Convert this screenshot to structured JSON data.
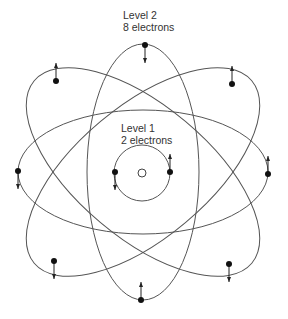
{
  "labels": {
    "level2_title": "Level 2",
    "level2_count": "8 electrons",
    "level1_title": "Level 1",
    "level1_count": "2 electrons"
  },
  "diagram": {
    "type": "atomic-shell-model",
    "nucleus": {
      "cx": 142,
      "cy": 173,
      "r": 4
    },
    "level1": {
      "orbit": {
        "cx": 142,
        "cy": 173,
        "r": 28
      },
      "electrons": [
        {
          "x": 115,
          "y": 172,
          "spin": "down"
        },
        {
          "x": 170,
          "y": 172,
          "spin": "up"
        }
      ]
    },
    "level2": {
      "orbits": [
        {
          "name": "horizontal",
          "cx": 143,
          "cy": 172,
          "rx": 125,
          "ry": 62,
          "rotate": 0
        },
        {
          "name": "vertical",
          "cx": 143,
          "cy": 172,
          "rx": 56,
          "ry": 128,
          "rotate": 0
        },
        {
          "name": "tilted-left",
          "cx": 143,
          "cy": 172,
          "rx": 142,
          "ry": 66,
          "rotate": 40
        },
        {
          "name": "tilted-right",
          "cx": 143,
          "cy": 172,
          "rx": 142,
          "ry": 66,
          "rotate": -40
        }
      ],
      "electrons": [
        {
          "x": 145,
          "y": 45,
          "spin": "down"
        },
        {
          "x": 56,
          "y": 81,
          "spin": "up"
        },
        {
          "x": 232,
          "y": 84,
          "spin": "up"
        },
        {
          "x": 18,
          "y": 171,
          "spin": "down"
        },
        {
          "x": 268,
          "y": 174,
          "spin": "up"
        },
        {
          "x": 54,
          "y": 261,
          "spin": "down"
        },
        {
          "x": 229,
          "y": 264,
          "spin": "down"
        },
        {
          "x": 141,
          "y": 300,
          "spin": "up"
        }
      ]
    }
  }
}
